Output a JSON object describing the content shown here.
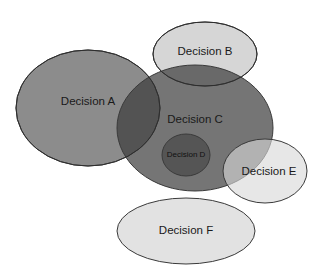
{
  "diagram": {
    "type": "overlapping-ellipses (Venn-style)",
    "nodes": [
      {
        "id": "A",
        "label": "Decision A",
        "cx": 88,
        "cy": 108,
        "rx": 72,
        "ry": 58,
        "fill": "#8c8c8c"
      },
      {
        "id": "B",
        "label": "Decision B",
        "cx": 205,
        "cy": 54,
        "rx": 52,
        "ry": 32,
        "fill": "#d6d6d6"
      },
      {
        "id": "C",
        "label": "Decision C",
        "cx": 195,
        "cy": 128,
        "rx": 78,
        "ry": 63,
        "fill": "#3a3a3a"
      },
      {
        "id": "D",
        "label": "Decision D",
        "cx": 186,
        "cy": 155,
        "rx": 24,
        "ry": 21,
        "fill": "#505050"
      },
      {
        "id": "E",
        "label": "Decision E",
        "cx": 265,
        "cy": 171,
        "rx": 42,
        "ry": 32,
        "fill": "#d8d8d8"
      },
      {
        "id": "F",
        "label": "Decision F",
        "cx": 186,
        "cy": 231,
        "rx": 69,
        "ry": 33,
        "fill": "#e2e2e2"
      }
    ],
    "relationships": [
      "Decision A overlaps Decision C",
      "Decision B overlaps Decision C",
      "Decision D is contained within Decision C",
      "Decision E overlaps Decision C",
      "Decision F is separate (no overlap)"
    ],
    "labels": {
      "a": "Decision A",
      "b": "Decision B",
      "c": "Decision C",
      "d": "Decision D",
      "e": "Decision E",
      "f": "Decision F"
    }
  }
}
